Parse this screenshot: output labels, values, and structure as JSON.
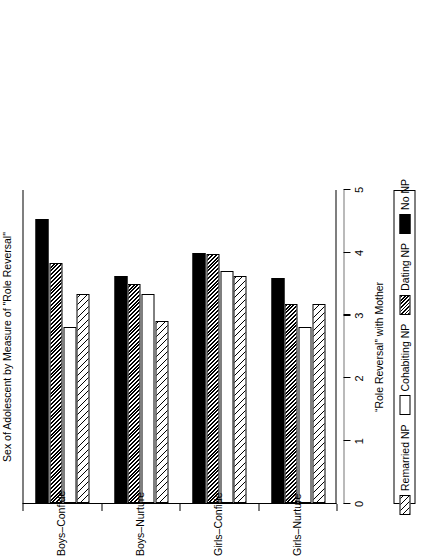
{
  "chart_data": {
    "type": "bar",
    "orientation": "horizontal",
    "title": "",
    "xlabel": "Sex of Adolescent by Measure of \"Role Reversal\"",
    "ylabel": "“Role Reversal” with Mother",
    "categories": [
      "Boys–Confide",
      "Boys–Nurture",
      "Girls–Confide",
      "Girls–Nurture"
    ],
    "series": [
      {
        "name": "Remarried NP",
        "pattern": "diagonal-hatch-wide",
        "values": [
          3.33,
          2.9,
          3.61,
          3.17
        ]
      },
      {
        "name": "Cohabiting NP",
        "pattern": "solid-white",
        "values": [
          2.81,
          3.33,
          3.69,
          2.81
        ]
      },
      {
        "name": "Dating NP",
        "pattern": "diagonal-hatch-dense",
        "values": [
          3.82,
          3.49,
          3.96,
          3.17
        ]
      },
      {
        "name": "No NP",
        "pattern": "solid-black",
        "values": [
          4.52,
          3.61,
          3.98,
          3.59
        ]
      }
    ],
    "ylim": [
      0,
      5
    ],
    "yticks": [
      0,
      1,
      2,
      3,
      4,
      5
    ],
    "ytick_labels": [
      "0",
      "1",
      "2",
      "3",
      "4",
      "5"
    ],
    "grid": false,
    "legend_position": "bottom",
    "legend_entries": [
      "Remarried NP",
      "Cohabiting NP",
      "Dating NP",
      "No NP"
    ],
    "colors": {
      "black": "#000000",
      "white": "#ffffff",
      "axis": "#000000"
    }
  },
  "axis": {
    "value_title": "“Role Reversal” with Mother",
    "category_title": "Sex of Adolescent by Measure of \"Role Reversal\"",
    "ticks": [
      "0",
      "1",
      "2",
      "3",
      "4",
      "5"
    ]
  },
  "legend": {
    "items": [
      {
        "label": "Remarried NP",
        "swatch": "hatch-wide-swatch"
      },
      {
        "label": "Cohabiting NP",
        "swatch": "white-swatch"
      },
      {
        "label": "Dating NP",
        "swatch": "hatch-dense-swatch"
      },
      {
        "label": "No NP",
        "swatch": "black-swatch"
      }
    ]
  }
}
